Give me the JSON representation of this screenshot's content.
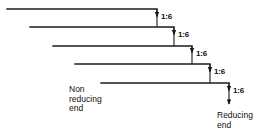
{
  "diagram": {
    "type": "branched-chain-staircase",
    "title_text": "",
    "line_color": "#1a1a1a",
    "background_color": "#ffffff",
    "chains": [
      {
        "id": "chain-1",
        "x_start": 7,
        "x_end": 157,
        "y": 9
      },
      {
        "id": "chain-2",
        "x_start": 30,
        "x_end": 174,
        "y": 27
      },
      {
        "id": "chain-3",
        "x_start": 53,
        "x_end": 192,
        "y": 46
      },
      {
        "id": "chain-4",
        "x_start": 75,
        "x_end": 210,
        "y": 64
      },
      {
        "id": "chain-5",
        "x_start": 101,
        "x_end": 229,
        "y": 83
      }
    ],
    "branch_points": [
      {
        "label": "1:6",
        "arrow_x": 157,
        "arrow_y_top": 9,
        "arrow_y_bottom": 21,
        "label_x": 161,
        "label_y": 13
      },
      {
        "label": "1:6",
        "arrow_x": 174,
        "arrow_y_top": 27,
        "arrow_y_bottom": 39,
        "label_x": 178,
        "label_y": 31
      },
      {
        "label": "1:6",
        "arrow_x": 192,
        "arrow_y_top": 46,
        "arrow_y_bottom": 57,
        "label_x": 196,
        "label_y": 49
      },
      {
        "label": "1:6",
        "arrow_x": 210,
        "arrow_y_top": 64,
        "arrow_y_bottom": 76,
        "label_x": 214,
        "label_y": 68
      },
      {
        "label": "1:6",
        "arrow_x": 229,
        "arrow_y_top": 83,
        "arrow_y_bottom": 104,
        "label_x": 233,
        "label_y": 86
      }
    ],
    "labels": {
      "non_reducing_end": "Non\nreducing\nend",
      "non_reducing_end_lines": [
        "Non",
        "reducing",
        "end"
      ],
      "reducing_end": "Reducing\nend",
      "reducing_end_lines": [
        "Reducing",
        "end"
      ]
    }
  }
}
